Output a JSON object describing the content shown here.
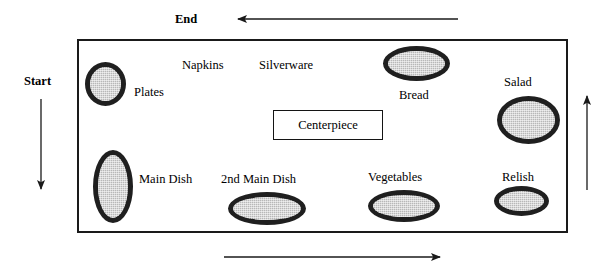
{
  "diagram": {
    "flow_labels": {
      "start": "Start",
      "end": "End"
    },
    "table": {
      "name": "buffet-table",
      "shape": "rectangle"
    },
    "centerpiece": {
      "label": "Centerpiece",
      "shape": "rectangle"
    },
    "dishes": [
      {
        "label": "Plates",
        "shape": "oval"
      },
      {
        "label": "Napkins",
        "shape": "text-only"
      },
      {
        "label": "Silverware",
        "shape": "text-only"
      },
      {
        "label": "Bread",
        "shape": "oval"
      },
      {
        "label": "Salad",
        "shape": "oval"
      },
      {
        "label": "Main Dish",
        "shape": "oval"
      },
      {
        "label": "2nd Main Dish",
        "shape": "oval"
      },
      {
        "label": "Vegetables",
        "shape": "oval"
      },
      {
        "label": "Relish",
        "shape": "oval"
      }
    ],
    "arrows": [
      {
        "name": "top-arrow",
        "direction": "left"
      },
      {
        "name": "left-arrow",
        "direction": "down"
      },
      {
        "name": "right-arrow",
        "direction": "up"
      },
      {
        "name": "bottom-arrow",
        "direction": "right"
      }
    ],
    "colors": {
      "line": "#1a1a1a",
      "dish_fill": "#b8b8b8",
      "dish_border": "#1f1f1f",
      "background": "#ffffff"
    }
  }
}
